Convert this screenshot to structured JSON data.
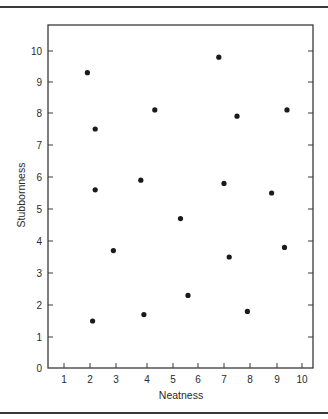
{
  "chart_data": {
    "type": "scatter",
    "title": "",
    "xlabel": "Neatness",
    "ylabel": "Stubbornness",
    "xlim": [
      0.4,
      10.4
    ],
    "ylim": [
      0,
      10.8
    ],
    "xticks": [
      1,
      2,
      3,
      4,
      5,
      6,
      7,
      8,
      9,
      10
    ],
    "yticks": [
      0,
      1,
      2,
      3,
      4,
      5,
      6,
      7,
      8,
      9,
      10
    ],
    "grid": false,
    "legend": null,
    "series": [
      {
        "name": "observations",
        "marker": "filled-circle",
        "color": "#1a1a1a",
        "points": [
          {
            "x": 1.9,
            "y": 9.3
          },
          {
            "x": 6.8,
            "y": 9.8
          },
          {
            "x": 4.3,
            "y": 8.1
          },
          {
            "x": 9.4,
            "y": 8.1
          },
          {
            "x": 7.5,
            "y": 7.9
          },
          {
            "x": 2.2,
            "y": 7.5
          },
          {
            "x": 3.8,
            "y": 5.9
          },
          {
            "x": 2.2,
            "y": 5.6
          },
          {
            "x": 7.0,
            "y": 5.8
          },
          {
            "x": 8.8,
            "y": 5.5
          },
          {
            "x": 5.3,
            "y": 4.7
          },
          {
            "x": 2.9,
            "y": 3.7
          },
          {
            "x": 7.2,
            "y": 3.5
          },
          {
            "x": 9.3,
            "y": 3.8
          },
          {
            "x": 2.1,
            "y": 1.5
          },
          {
            "x": 3.9,
            "y": 1.7
          },
          {
            "x": 5.6,
            "y": 2.3
          },
          {
            "x": 7.9,
            "y": 1.8
          }
        ]
      }
    ]
  },
  "layout": {
    "frame": {
      "left": 48,
      "top": 25,
      "right": 313,
      "bottom": 368
    },
    "x_tick_px": [
      64,
      90,
      116,
      147,
      173,
      198,
      224,
      250,
      277,
      302
    ],
    "y_tick_px": [
      368,
      337,
      305,
      273,
      241,
      209,
      177,
      145,
      113,
      82,
      51
    ]
  }
}
